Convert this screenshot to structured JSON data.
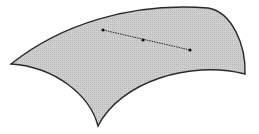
{
  "diagram": {
    "type": "curved-surface-with-geodesic",
    "colors": {
      "surface_fill": "#c9c9c9",
      "surface_stroke": "#2a2a2a",
      "segment": "#222222",
      "point": "#111111",
      "background": "#ffffff"
    },
    "surface": {
      "vertices": [
        [
          11,
          64
        ],
        [
          208,
          8
        ],
        [
          245,
          74
        ],
        [
          98,
          126
        ]
      ]
    },
    "segment": {
      "style": "dotted",
      "points": [
        [
          103,
          30
        ],
        [
          143,
          40
        ],
        [
          190,
          50
        ]
      ]
    }
  }
}
